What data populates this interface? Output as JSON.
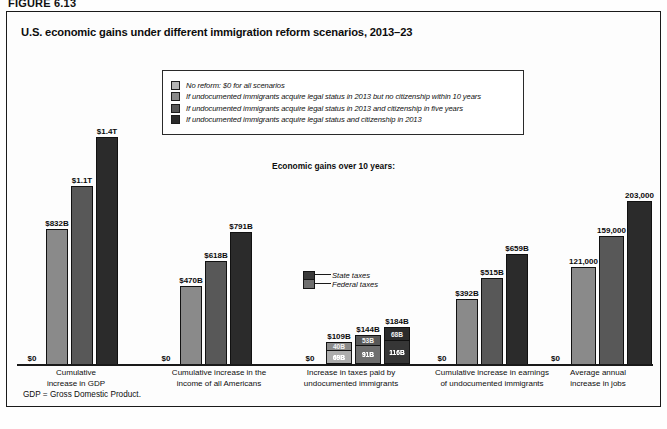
{
  "figure": {
    "number": "FIGURE 6.13",
    "title": "U.S. economic gains under different immigration reform scenarios, 2013–23",
    "subtitle": "Economic gains over 10 years:",
    "footnote": "GDP = Gross Domestic Product."
  },
  "legend": {
    "items": [
      {
        "label": "No reform: $0 for all scenarios",
        "color": "#b4b4b4"
      },
      {
        "label": "If undocumented immigrants acquire legal status in 2013 but no citizenship within 10 years",
        "color": "#8a8a8a"
      },
      {
        "label": "If undocumented immigrants acquire legal status in 2013 and citizenship in five years",
        "color": "#585858"
      },
      {
        "label": "If undocumented immigrants acquire legal status and citizenship in 2013",
        "color": "#2b2b2b"
      }
    ]
  },
  "sub_legend": {
    "items": [
      {
        "label": "State taxes",
        "color": "#3a3a3a"
      },
      {
        "label": "Federal taxes",
        "color": "#6f6f6f"
      }
    ]
  },
  "chart_data": {
    "type": "bar",
    "title": "U.S. economic gains under different immigration reform scenarios, 2013–23",
    "subtitle": "Economic gains over 10 years:",
    "xlabel": "",
    "ylabel": "",
    "grid": false,
    "legend_position": "top-center",
    "categories": [
      "Cumulative increase in GDP",
      "Cumulative increase in the income of all Americans",
      "Increase in taxes paid by undocumented immigrants",
      "Cumulative increase in earnings of undocumented immigrants",
      "Average annual increase in jobs"
    ],
    "series": [
      {
        "name": "No reform: $0 for all scenarios",
        "color": "#b4b4b4",
        "labels": [
          "$0",
          "$0",
          "$0",
          "$0",
          "$0"
        ],
        "values": [
          0,
          0,
          0,
          0,
          0
        ]
      },
      {
        "name": "If undocumented immigrants acquire legal status in 2013 but no citizenship within 10 years",
        "color": "#8a8a8a",
        "labels": [
          "$832B",
          "$470B",
          "$109B",
          "$392B",
          "121,000"
        ],
        "values": [
          832,
          470,
          109,
          392,
          121000
        ]
      },
      {
        "name": "If undocumented immigrants acquire legal status in 2013 and citizenship in five years",
        "color": "#585858",
        "labels": [
          "$1.1T",
          "$618B",
          "$144B",
          "$515B",
          "159,000"
        ],
        "values": [
          1100,
          618,
          144,
          515,
          159000
        ]
      },
      {
        "name": "If undocumented immigrants acquire legal status and citizenship in 2013",
        "color": "#2b2b2b",
        "labels": [
          "$1.4T",
          "$791B",
          "$184B",
          "$659B",
          "203,000"
        ],
        "values": [
          1400,
          791,
          184,
          659,
          203000
        ]
      }
    ],
    "stacked_group": {
      "category": "Increase in taxes paid by undocumented immigrants",
      "components": [
        "State taxes",
        "Federal taxes"
      ],
      "bars": [
        {
          "total_label": "$0",
          "state": null,
          "federal": null
        },
        {
          "total_label": "$109B",
          "state_label": "40B",
          "federal_label": "69B",
          "state": 40,
          "federal": 69
        },
        {
          "total_label": "$144B",
          "state_label": "53B",
          "federal_label": "91B",
          "state": 53,
          "federal": 91
        },
        {
          "total_label": "$184B",
          "state_label": "68B",
          "federal_label": "116B",
          "state": 68,
          "federal": 116
        }
      ]
    }
  },
  "groups": [
    {
      "xlabel_line1": "Cumulative",
      "xlabel_line2": "increase in GDP",
      "bars": [
        {
          "label": "$0",
          "h": 0,
          "color": "#b4b4b4"
        },
        {
          "label": "$832B",
          "h": 135,
          "color": "#8a8a8a"
        },
        {
          "label": "$1.1T",
          "h": 178,
          "color": "#585858"
        },
        {
          "label": "$1.4T",
          "h": 227,
          "color": "#2b2b2b"
        }
      ]
    },
    {
      "xlabel_line1": "Cumulative increase in the",
      "xlabel_line2": "income of all Americans",
      "bars": [
        {
          "label": "$0",
          "h": 0,
          "color": "#b4b4b4"
        },
        {
          "label": "$470B",
          "h": 78,
          "color": "#8a8a8a"
        },
        {
          "label": "$618B",
          "h": 103,
          "color": "#585858"
        },
        {
          "label": "$791B",
          "h": 132,
          "color": "#2b2b2b"
        }
      ]
    },
    {
      "xlabel_line1": "Increase in taxes paid by",
      "xlabel_line2": "undocumented immigrants",
      "bars": [
        {
          "label": "$0",
          "h": 0,
          "color": "#b4b4b4"
        },
        {
          "label": "$109B",
          "h": 22,
          "color": "#8a8a8a",
          "state_label": "40B",
          "federal_label": "69B",
          "state_h": 9,
          "federal_h": 13
        },
        {
          "label": "$144B",
          "h": 29,
          "color": "#585858",
          "state_label": "53B",
          "federal_label": "91B",
          "state_h": 11,
          "federal_h": 18
        },
        {
          "label": "$184B",
          "h": 37,
          "color": "#2b2b2b",
          "state_label": "68B",
          "federal_label": "116B",
          "state_h": 14,
          "federal_h": 23
        }
      ]
    },
    {
      "xlabel_line1": "Cumulative increase in earnings",
      "xlabel_line2": "of undocumented immigrants",
      "bars": [
        {
          "label": "$0",
          "h": 0,
          "color": "#b4b4b4"
        },
        {
          "label": "$392B",
          "h": 65,
          "color": "#8a8a8a"
        },
        {
          "label": "$515B",
          "h": 86,
          "color": "#585858"
        },
        {
          "label": "$659B",
          "h": 110,
          "color": "#2b2b2b"
        }
      ]
    },
    {
      "xlabel_line1": "Average annual",
      "xlabel_line2": "increase in jobs",
      "bars": [
        {
          "label": "$0",
          "h": 0,
          "color": "#b4b4b4"
        },
        {
          "label": "121,000",
          "h": 97,
          "color": "#8a8a8a"
        },
        {
          "label": "159,000",
          "h": 128,
          "color": "#585858"
        },
        {
          "label": "203,000",
          "h": 163,
          "color": "#2b2b2b"
        }
      ]
    }
  ]
}
